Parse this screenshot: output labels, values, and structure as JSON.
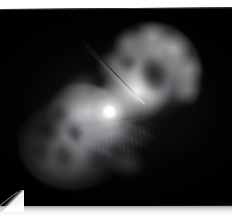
{
  "viewer": {
    "name": "astronomical-image-viewer",
    "width": 232,
    "height": 216,
    "background_color": "#ffffff",
    "alt_text": "Bipolar reflection nebula with two large dusty lobes and a bright central star"
  },
  "plate": {
    "name": "photographic-plate",
    "background_color": "#000000",
    "rotation_degrees": -0.45
  },
  "page": {
    "sheet_color": "#ffffff",
    "bottom_band_color": "#c9c9c9",
    "corner_curl": "bottom-left"
  },
  "image_content": {
    "subject": "bipolar nebula",
    "palette": "greyscale",
    "features": [
      {
        "id": "lobe-ne",
        "label": "upper-right lobe",
        "description": "large clumpy dust lobe with dark interior cavity and bright knotty rim"
      },
      {
        "id": "lobe-sw",
        "label": "lower-left lobe",
        "description": "smaller mottled dust lobe with dark absorption knots"
      },
      {
        "id": "core",
        "label": "central star",
        "description": "saturated white point source at the waist between the two lobes"
      },
      {
        "id": "jet",
        "label": "equatorial jet streak",
        "description": "thin linear feature extending down-left from the core"
      },
      {
        "id": "skirt",
        "label": "equatorial skirt",
        "description": "striated fan of ragged streamers below the waist"
      },
      {
        "id": "wisps",
        "label": "outer wisps",
        "description": "faint diffuse nebulosity at the outer edges"
      }
    ]
  }
}
